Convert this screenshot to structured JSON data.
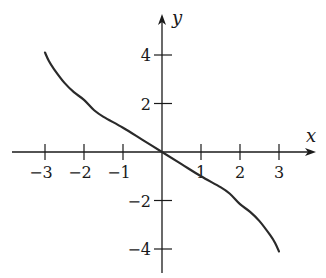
{
  "chart_data": {
    "type": "line",
    "title": "",
    "xlabel": "x",
    "ylabel": "y",
    "xlim": [
      -3.8,
      3.9
    ],
    "ylim": [
      -5,
      5.6
    ],
    "grid": false,
    "legend": null,
    "x_ticks": [
      -3,
      -2,
      -1,
      1,
      2,
      3
    ],
    "x_tick_labels": [
      "−3",
      "−2",
      "−1",
      "1",
      "2",
      "3"
    ],
    "y_ticks": [
      4,
      2,
      -2,
      -4
    ],
    "y_tick_labels": [
      "4",
      "2",
      "−2",
      "−4"
    ],
    "series": [
      {
        "name": "f(x)",
        "color": "#2a2a2a",
        "x": [
          -3.0,
          -2.9,
          -2.77,
          -2.5,
          -2.26,
          -2.0,
          -1.74,
          -1.5,
          -1.0,
          -0.5,
          0,
          0.5,
          1.0,
          1.5,
          1.74,
          2.0,
          2.26,
          2.5,
          2.77,
          2.9,
          3.0
        ],
        "y": [
          4.1,
          3.75,
          3.42,
          2.85,
          2.47,
          2.15,
          1.72,
          1.45,
          1.0,
          0.5,
          0,
          -0.5,
          -1.0,
          -1.45,
          -1.72,
          -2.15,
          -2.47,
          -2.85,
          -3.42,
          -3.75,
          -4.1
        ]
      }
    ]
  },
  "layout": {
    "origin_px": [
      162,
      152
    ],
    "x_unit_px": 39,
    "y_unit_px": 24.25,
    "x_axis_px": [
      12,
      316
    ],
    "y_axis_px": [
      273,
      14
    ]
  }
}
